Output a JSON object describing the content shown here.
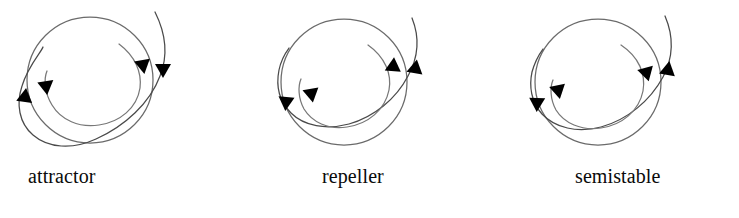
{
  "figure": {
    "background_color": "#ffffff",
    "stroke_color": "#555555",
    "arrowhead_color": "#000000",
    "panel_count": 3
  },
  "panels": [
    {
      "id": "attractor",
      "label": "attractor",
      "limit_cycle": {
        "cx": 90,
        "cy": 80,
        "r": 64
      },
      "outer_trajectory": {
        "direction": "inward",
        "arrow_outer": "down",
        "arrow_left": "up"
      },
      "inner_trajectory": {
        "direction": "outward",
        "arrow_inner": "down",
        "arrow_left": "up-right"
      },
      "arrowheads": [
        {
          "name": "outer-right-arrowhead",
          "x": 163,
          "y": 70,
          "angle": 100
        },
        {
          "name": "inner-right-arrowhead",
          "x": 143,
          "y": 66,
          "angle": 103
        },
        {
          "name": "outer-left-arrowhead",
          "x": 26,
          "y": 96,
          "angle": 285
        },
        {
          "name": "inner-left-arrowhead",
          "x": 47,
          "y": 85,
          "angle": 320
        }
      ]
    },
    {
      "id": "repeller",
      "label": "repeller",
      "limit_cycle": {
        "cx": 95,
        "cy": 80,
        "r": 64
      },
      "outer_trajectory": {
        "direction": "outward",
        "arrow_outer": "down",
        "arrow_left": "down"
      },
      "inner_trajectory": {
        "direction": "outward",
        "arrow_inner": "right",
        "arrow_left": "up-left"
      },
      "arrowheads": [
        {
          "name": "outer-right-arrowhead",
          "x": 168,
          "y": 68,
          "angle": 75
        },
        {
          "name": "inner-right-arrowhead",
          "x": 145,
          "y": 66,
          "angle": 68
        },
        {
          "name": "outer-left-arrowhead",
          "x": 42,
          "y": 102,
          "angle": 95
        },
        {
          "name": "inner-left-arrowhead",
          "x": 66,
          "y": 92,
          "angle": 243
        }
      ]
    },
    {
      "id": "semistable",
      "label": "semistable",
      "limit_cycle": {
        "cx": 100,
        "cy": 82,
        "r": 64
      },
      "outer_trajectory": {
        "direction": "inward",
        "arrow_outer": "up",
        "arrow_left": "down"
      },
      "inner_trajectory": {
        "direction": "inward",
        "arrow_inner": "left",
        "arrow_left": "up-right"
      },
      "arrowheads": [
        {
          "name": "outer-right-arrowhead",
          "x": 173,
          "y": 68,
          "angle": 282
        },
        {
          "name": "inner-right-arrowhead",
          "x": 150,
          "y": 71,
          "angle": 285
        },
        {
          "name": "outer-left-arrowhead",
          "x": 45,
          "y": 103,
          "angle": 95
        },
        {
          "name": "inner-left-arrowhead",
          "x": 67,
          "y": 88,
          "angle": 315
        }
      ]
    }
  ]
}
